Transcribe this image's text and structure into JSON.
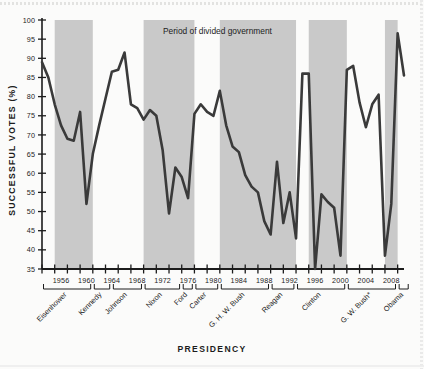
{
  "chart_data": {
    "type": "line",
    "title": "",
    "xlabel": "PRESIDENCY",
    "ylabel": "SUCCESSFUL VOTES (%)",
    "ylim": [
      35,
      100
    ],
    "ytick_step": 5,
    "yticks": [
      35,
      40,
      45,
      50,
      55,
      60,
      65,
      70,
      75,
      80,
      85,
      90,
      95,
      100
    ],
    "xlim": [
      1953,
      2010
    ],
    "xticks_labeled": [
      1956,
      1960,
      1964,
      1968,
      1972,
      1976,
      1980,
      1984,
      1988,
      1992,
      1996,
      2000,
      2004,
      2008
    ],
    "xtick_minor_step": 2,
    "grid": false,
    "legend": {
      "position": "top-center",
      "entries": [
        {
          "label": "Period of divided government",
          "swatch_color": "#c9c9c9",
          "type": "band"
        }
      ]
    },
    "series": [
      {
        "name": "Successful votes",
        "color": "#3a3a3a",
        "x": [
          1953,
          1954,
          1955,
          1956,
          1957,
          1958,
          1959,
          1960,
          1961,
          1962,
          1963,
          1964,
          1965,
          1966,
          1967,
          1968,
          1969,
          1970,
          1971,
          1972,
          1973,
          1974,
          1975,
          1976,
          1977,
          1978,
          1979,
          1980,
          1981,
          1982,
          1983,
          1984,
          1985,
          1986,
          1987,
          1988,
          1989,
          1990,
          1991,
          1992,
          1993,
          1994,
          1995,
          1996,
          1997,
          1998,
          1999,
          2000,
          2001,
          2002,
          2003,
          2004,
          2005,
          2006,
          2007,
          2008,
          2009,
          2010
        ],
        "y": [
          89.0,
          85.0,
          78.0,
          72.5,
          69.0,
          68.5,
          76.0,
          52.0,
          65.0,
          72.5,
          79.5,
          86.5,
          87.0,
          91.5,
          78.0,
          77.0,
          74.0,
          76.5,
          75.0,
          66.0,
          49.5,
          61.5,
          59.0,
          53.5,
          75.5,
          78.0,
          76.0,
          75.0,
          81.5,
          72.5,
          67.0,
          65.5,
          59.5,
          56.5,
          55.0,
          47.5,
          44.0,
          63.0,
          47.0,
          55.0,
          43.0,
          86.0,
          86.0,
          35.0,
          54.5,
          52.5,
          51.0,
          38.5,
          87.0,
          88.0,
          78.5,
          72.0,
          78.0,
          80.5,
          38.5,
          52.0,
          96.5,
          85.5
        ]
      }
    ],
    "shaded_bands": [
      {
        "label": "divided government",
        "x0": 1955,
        "x1": 1961,
        "color": "#c9c9c9"
      },
      {
        "label": "divided government",
        "x0": 1969,
        "x1": 1977,
        "color": "#c9c9c9"
      },
      {
        "label": "divided government",
        "x0": 1981,
        "x1": 1993,
        "color": "#c9c9c9"
      },
      {
        "label": "divided government",
        "x0": 1995,
        "x1": 2001,
        "color": "#c9c9c9"
      },
      {
        "label": "divided government",
        "x0": 2007,
        "x1": 2009,
        "color": "#c9c9c9"
      }
    ],
    "presidency_brackets": [
      {
        "label": "Eisenhower",
        "x0": 1953,
        "x1": 1960
      },
      {
        "label": "Kennedy",
        "x0": 1961,
        "x1": 1963
      },
      {
        "label": "Johnson",
        "x0": 1964,
        "x1": 1968
      },
      {
        "label": "Nixon",
        "x0": 1969,
        "x1": 1974
      },
      {
        "label": "Ford",
        "x0": 1975,
        "x1": 1976
      },
      {
        "label": "Carter",
        "x0": 1977,
        "x1": 1980
      },
      {
        "label": "G. H. W. Bush",
        "x0": 1981,
        "x1": 1988
      },
      {
        "label": "Reagan",
        "x0": 1989,
        "x1": 1992
      },
      {
        "label": "Clinton",
        "x0": 1993,
        "x1": 2000
      },
      {
        "label": "G. W. Bush*",
        "x0": 2001,
        "x1": 2008
      },
      {
        "label": "Obama",
        "x0": 2009,
        "x1": 2010
      }
    ]
  }
}
